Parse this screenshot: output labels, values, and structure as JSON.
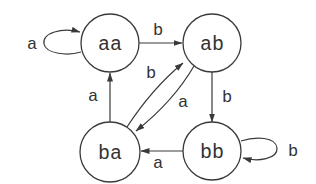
{
  "diagram": {
    "type": "state-transition-diagram",
    "stroke_color": "#3a3a3a",
    "background_color": "#ffffff",
    "nodes": [
      {
        "id": "aa",
        "label": "aa",
        "cx": 110,
        "cy": 43,
        "r": 29
      },
      {
        "id": "ab",
        "label": "ab",
        "cx": 212,
        "cy": 43,
        "r": 29
      },
      {
        "id": "ba",
        "label": "ba",
        "cx": 110,
        "cy": 152,
        "r": 30
      },
      {
        "id": "bb",
        "label": "bb",
        "cx": 212,
        "cy": 151,
        "r": 29
      }
    ],
    "edges": [
      {
        "from": "aa",
        "to": "aa",
        "label": "a",
        "kind": "self-loop"
      },
      {
        "from": "aa",
        "to": "ab",
        "label": "b"
      },
      {
        "from": "ab",
        "to": "bb",
        "label": "b"
      },
      {
        "from": "bb",
        "to": "bb",
        "label": "b",
        "kind": "self-loop"
      },
      {
        "from": "bb",
        "to": "ba",
        "label": "a"
      },
      {
        "from": "ba",
        "to": "aa",
        "label": "a"
      },
      {
        "from": "ba",
        "to": "ab",
        "label": "b"
      },
      {
        "from": "ab",
        "to": "ba",
        "label": "a"
      }
    ]
  }
}
